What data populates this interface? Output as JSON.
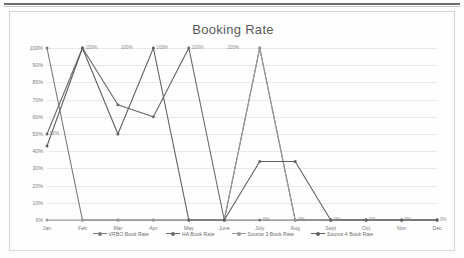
{
  "chart_data": {
    "type": "line",
    "title": "Booking Rate",
    "xlabel": "",
    "ylabel": "",
    "categories": [
      "Jan",
      "Feb",
      "Mar",
      "Apr",
      "May",
      "June",
      "July",
      "Aug",
      "Sept",
      "Oct",
      "Nov",
      "Dec"
    ],
    "ytick_labels": [
      "100%",
      "90%",
      "80%",
      "70%",
      "60%",
      "50%",
      "40%",
      "30%",
      "20%",
      "10%",
      "0%"
    ],
    "ytick_values": [
      100,
      90,
      80,
      70,
      60,
      50,
      40,
      30,
      20,
      10,
      0
    ],
    "ylim": [
      0,
      100
    ],
    "grid": true,
    "legend_position": "bottom",
    "series": [
      {
        "name": "VRBO Book Rate",
        "color": "#7a7a7a",
        "values": [
          100,
          0,
          0,
          0,
          0,
          0,
          0,
          0,
          0,
          0,
          0,
          0
        ]
      },
      {
        "name": "HA Book Rate",
        "color": "#6b6b6b",
        "values": [
          50,
          100,
          67,
          60,
          100,
          0,
          100,
          0,
          0,
          0,
          0,
          0
        ]
      },
      {
        "name": "Source 3 Book Rate",
        "color": "#9a9a9a",
        "values": [
          0,
          0,
          0,
          0,
          0,
          0,
          100,
          0,
          0,
          0,
          0,
          0
        ]
      },
      {
        "name": "Source 4 Book Rate",
        "color": "#5f5f5f",
        "values": [
          43,
          100,
          50,
          100,
          0,
          0,
          34,
          34,
          0,
          0,
          0,
          0
        ]
      }
    ],
    "data_labels": [
      {
        "text": "100%",
        "category": "Feb",
        "value": 100
      },
      {
        "text": "100%",
        "category": "Mar",
        "value": 100
      },
      {
        "text": "100%",
        "category": "Apr",
        "value": 100
      },
      {
        "text": "100%",
        "category": "May",
        "value": 100
      },
      {
        "text": "100%",
        "category": "June",
        "value": 100
      },
      {
        "text": "50%",
        "category": "Jan",
        "value": 50
      },
      {
        "text": "0%",
        "category": "July",
        "value": 0
      },
      {
        "text": "0%",
        "category": "Aug",
        "value": 0
      },
      {
        "text": "0%",
        "category": "Sept",
        "value": 0
      },
      {
        "text": "0%",
        "category": "Oct",
        "value": 0
      },
      {
        "text": "0%",
        "category": "Nov",
        "value": 0
      },
      {
        "text": "0%",
        "category": "Dec",
        "value": 0
      }
    ]
  }
}
